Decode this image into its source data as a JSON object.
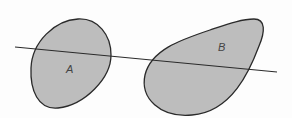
{
  "diagram": {
    "colors": {
      "fill": "#bdbdbd",
      "stroke": "#2a2a2a",
      "background": "#fdfdfd"
    },
    "regions": [
      {
        "id": "A",
        "label": "A"
      },
      {
        "id": "B",
        "label": "B"
      }
    ],
    "line": {
      "from": [
        15,
        47
      ],
      "to": [
        277,
        72
      ]
    }
  }
}
